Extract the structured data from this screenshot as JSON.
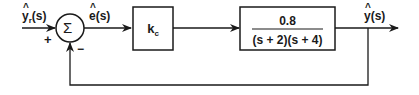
{
  "diagram": {
    "type": "feedback-control-block-diagram",
    "input": {
      "symbol": "y",
      "subscript": "r",
      "arg": "(s)"
    },
    "summing_junction": {
      "symbol": "Σ",
      "plus_sign": "+",
      "minus_sign": "−"
    },
    "error": {
      "symbol": "e",
      "arg": "(s)"
    },
    "controller": {
      "symbol": "k",
      "subscript": "c"
    },
    "plant": {
      "numerator": "0.8",
      "denominator": "(s + 2)(s + 4)"
    },
    "output": {
      "symbol": "y",
      "arg": "(s)"
    }
  }
}
